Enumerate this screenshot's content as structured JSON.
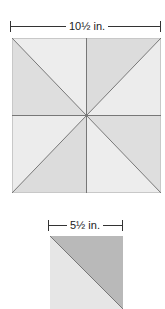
{
  "diagram": {
    "large_block": {
      "dimension_label": "10½ in.",
      "description": "Square block divided into 8 triangles by vertical, horizontal and both diagonal lines",
      "colors": {
        "light": "#ececec",
        "medium": "#dedede",
        "line": "#777777"
      }
    },
    "small_block": {
      "dimension_label": "5½ in.",
      "description": "Half-square triangle: upper-right darker gray, lower-left light gray",
      "colors": {
        "light": "#e6e6e6",
        "dark": "#b9b9b9",
        "line": "#777777"
      }
    }
  }
}
